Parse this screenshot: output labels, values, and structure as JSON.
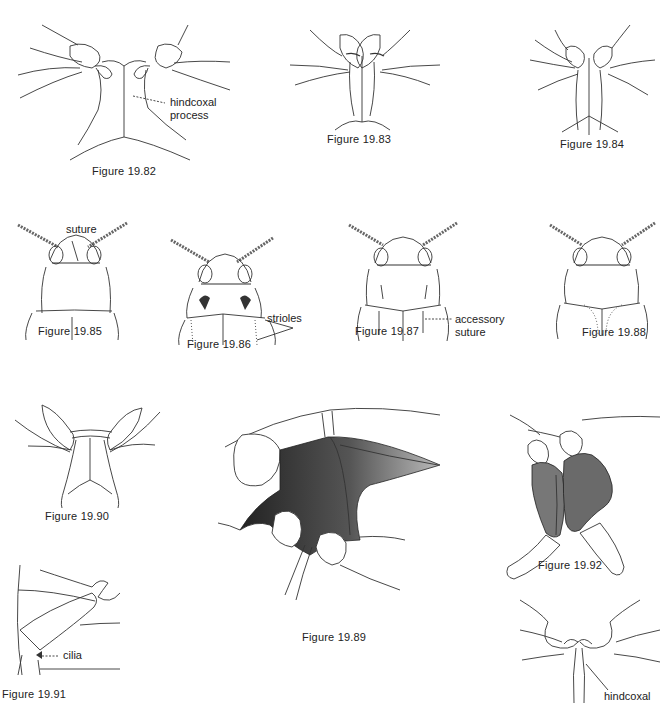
{
  "page": {
    "type": "textbook-figure-plate"
  },
  "figures": [
    {
      "id": "19.82",
      "caption": "Figure 19.82",
      "labels": [
        "hindcoxal process"
      ]
    },
    {
      "id": "19.83",
      "caption": "Figure 19.83",
      "labels": []
    },
    {
      "id": "19.84",
      "caption": "Figure 19.84",
      "labels": []
    },
    {
      "id": "19.85",
      "caption": "Figure 19.85",
      "labels": [
        "suture"
      ]
    },
    {
      "id": "19.86",
      "caption": "Figure 19.86",
      "labels": [
        "strioles"
      ]
    },
    {
      "id": "19.87",
      "caption": "Figure 19.87",
      "labels": [
        "accessory",
        "suture"
      ]
    },
    {
      "id": "19.88",
      "caption": "Figure 19.88",
      "labels": []
    },
    {
      "id": "19.90",
      "caption": "Figure 19.90",
      "labels": []
    },
    {
      "id": "19.89",
      "caption": "Figure 19.89",
      "labels": []
    },
    {
      "id": "19.92",
      "caption": "Figure 19.92",
      "labels": []
    },
    {
      "id": "19.91",
      "caption": "Figure 19.91",
      "labels": [
        "cilia"
      ]
    },
    {
      "id": "19.93",
      "caption": "",
      "labels": [
        "hindcoxal"
      ]
    }
  ],
  "labels": {
    "f82_line1": "hindcoxal",
    "f82_line2": "process",
    "f85": "suture",
    "f86": "strioles",
    "f87_line1": "accessory",
    "f87_line2": "suture",
    "f91": "cilia",
    "f93": "hindcoxal"
  },
  "captions": {
    "f82": "Figure 19.82",
    "f83": "Figure 19.83",
    "f84": "Figure 19.84",
    "f85": "Figure 19.85",
    "f86": "Figure 19.86",
    "f87": "Figure 19.87",
    "f88": "Figure 19.88",
    "f89": "Figure 19.89",
    "f90": "Figure 19.90",
    "f91": "Figure 19.91",
    "f92": "Figure 19.92"
  }
}
